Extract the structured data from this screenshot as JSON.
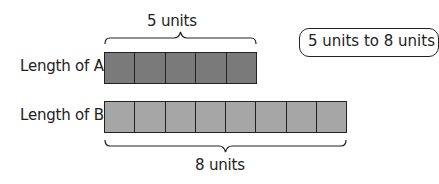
{
  "diagram": {
    "bar_a": {
      "label": "Length of A",
      "units": 5,
      "brace_label": "5 units",
      "fill": "#7a7a7a"
    },
    "bar_b": {
      "label": "Length of B",
      "units": 8,
      "brace_label": "8 units",
      "fill": "#a6a6a6"
    },
    "callout": {
      "text": "5 units to 8 units"
    }
  }
}
